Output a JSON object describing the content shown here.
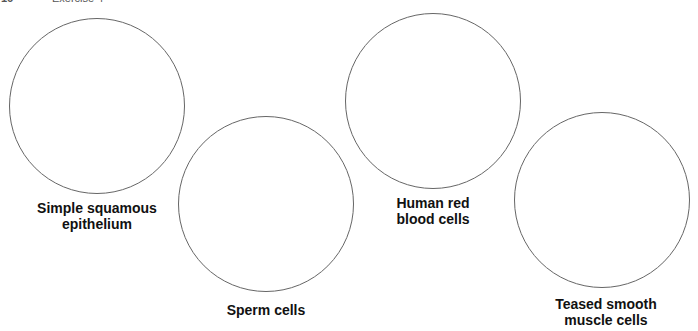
{
  "header": {
    "page_number": "16",
    "section": "Exercise 4"
  },
  "drawing_circles": [
    {
      "label": "Simple squamous\nepithelium",
      "cx": 97,
      "cy": 106,
      "r": 88,
      "label_x": 97,
      "label_y": 200
    },
    {
      "label": "Sperm cells",
      "cx": 266,
      "cy": 204,
      "r": 88,
      "label_x": 266,
      "label_y": 302
    },
    {
      "label": "Human red\nblood cells",
      "cx": 433,
      "cy": 101,
      "r": 88,
      "label_x": 433,
      "label_y": 195
    },
    {
      "label": "Teased smooth\nmuscle cells",
      "cx": 602,
      "cy": 200,
      "r": 88,
      "label_x": 606,
      "label_y": 296
    }
  ]
}
